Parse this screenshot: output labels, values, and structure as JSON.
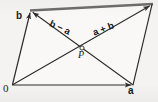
{
  "figure": {
    "kind": "vector-parallelogram-diagram",
    "background_color": "#f4f3f1",
    "stroke_color": "#2b2b2b",
    "top_edge_color": "#6e6d6b",
    "width": 158,
    "height": 102
  },
  "labels": {
    "origin": "0",
    "vector_a": "a",
    "vector_b": "b",
    "point_p": "P",
    "diagonal_b_minus_a": "b − a",
    "diagonal_a_plus_b": "a + b"
  },
  "vertices": {
    "origin": {
      "name": "0",
      "x": 12,
      "y": 85
    },
    "a_tip": {
      "name": "a",
      "x": 133,
      "y": 85
    },
    "b_tip": {
      "name": "b",
      "x": 31,
      "y": 10
    },
    "sum_tip": {
      "name": "a + b",
      "x": 152,
      "y": 4
    },
    "intersection": {
      "name": "P",
      "x": 82,
      "y": 48
    }
  },
  "segments": [
    {
      "name": "vector-a-edge",
      "from": "origin",
      "to": "a_tip",
      "arrow": true,
      "style": "thin"
    },
    {
      "name": "vector-b-edge",
      "from": "origin",
      "to": "b_tip",
      "arrow": true,
      "style": "thin"
    },
    {
      "name": "top-edge",
      "from": "b_tip",
      "to": "sum_tip",
      "arrow": false,
      "style": "thick-gray"
    },
    {
      "name": "right-edge",
      "from": "a_tip",
      "to": "sum_tip",
      "arrow": false,
      "style": "thin"
    },
    {
      "name": "diagonal-a-plus-b",
      "from": "origin",
      "to": "sum_tip",
      "arrow": true,
      "style": "thin"
    },
    {
      "name": "diagonal-b-minus-a",
      "from": "a_tip",
      "to": "b_tip",
      "arrow": true,
      "style": "thin"
    }
  ]
}
